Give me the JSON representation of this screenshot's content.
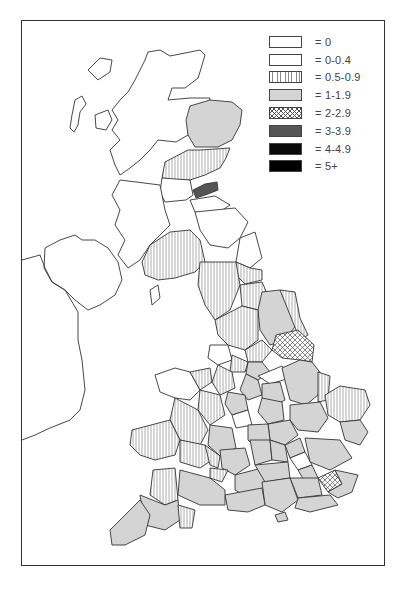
{
  "map": {
    "subject": "United Kingdom choropleth by county/region",
    "legend": [
      {
        "label": "= 0",
        "fill": "white",
        "pattern": "none"
      },
      {
        "label": "= 0-0.4",
        "fill": "white",
        "pattern": "none"
      },
      {
        "label": "= 0.5-0.9",
        "fill": "vertical-hatch",
        "pattern": "vertical-lines"
      },
      {
        "label": "= 1-1.9",
        "fill": "#d4d4d4",
        "pattern": "solid-light-grey"
      },
      {
        "label": "= 2-2.9",
        "fill": "crosshatch",
        "pattern": "crosshatch"
      },
      {
        "label": "= 3-3.9",
        "fill": "#555555",
        "pattern": "solid-dark-grey"
      },
      {
        "label": "= 4-4.9",
        "fill": "#0a0a0a",
        "pattern": "solid-black"
      },
      {
        "label": "= 5+",
        "fill": "#000000",
        "pattern": "solid-black"
      }
    ],
    "colors": {
      "border": "#333333",
      "light_grey": "#d4d4d4",
      "dark_grey": "#555555",
      "black": "#050505",
      "hatch_line": "#888888"
    }
  }
}
